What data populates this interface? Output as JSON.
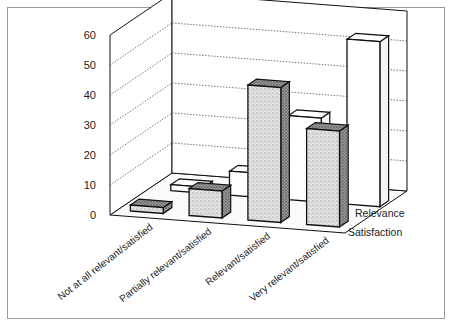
{
  "chart_data": {
    "type": "bar",
    "subtype": "3d-grouped-depth",
    "title": "",
    "xlabel": "",
    "ylabel": "",
    "ylim": [
      0,
      60
    ],
    "yticks": [
      0,
      10,
      20,
      30,
      40,
      50,
      60
    ],
    "grid": true,
    "categories": [
      "Not at all relevant/satisfied",
      "Partially relevant/satisfied",
      "Relevant/satisfied",
      "Very relevant/satisfied"
    ],
    "series": [
      {
        "name": "Satisfaction",
        "values": [
          2,
          9,
          45,
          32
        ],
        "style": "stippled-dark"
      },
      {
        "name": "Relevance",
        "values": [
          2,
          8,
          28,
          55
        ],
        "style": "white"
      }
    ],
    "depth_labels": [
      "Relevance",
      "Satisfaction"
    ],
    "legend_position": "depth-axis-right"
  },
  "labels": {
    "yticks": [
      "0",
      "10",
      "20",
      "30",
      "40",
      "50",
      "60"
    ],
    "categories": [
      "Not at all relevant/satisfied",
      "Partially relevant/satisfied",
      "Relevant/satisfied",
      "Very relevant/satisfied"
    ],
    "series_back": "Relevance",
    "series_front": "Satisfaction"
  },
  "colors": {
    "stipple_fill": "#d8d8d8",
    "stipple_side": "#8a8a8a",
    "white_fill": "#ffffff",
    "line": "#111111",
    "grid": "#555555",
    "frame": "#9a9a9a"
  }
}
